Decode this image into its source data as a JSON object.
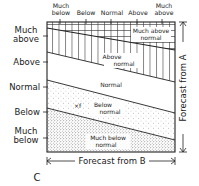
{
  "figure": {
    "panel_label": "C",
    "x_axis_title": "Forecast from B",
    "y_axis_title": "Forecast from A",
    "top_labels": {
      "much_below_1": "Much",
      "much_below_2": "below",
      "below": "Below",
      "normal": "Normal",
      "above": "Above",
      "much_above_1": "Much",
      "much_above_2": "above"
    },
    "left_labels": {
      "much_above_1": "Much",
      "much_above_2": "above",
      "above": "Above",
      "normal": "Normal",
      "below": "Below",
      "much_below_1": "Much",
      "much_below_2": "below"
    },
    "zones": {
      "much_above_1": "Much above",
      "much_above_2": "normal",
      "above_1": "Above",
      "above_2": "normal",
      "normal": "Normal",
      "below_1": "Below",
      "below_2": "normal",
      "much_below_1": "Much below",
      "much_below_2": "normal"
    },
    "annotation_mark": "×f",
    "colors": {
      "ink": "#222222",
      "background": "#ffffff"
    }
  }
}
